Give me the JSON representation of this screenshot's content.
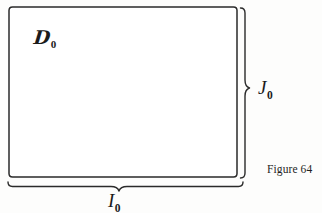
{
  "figure": {
    "caption": "Figure 64",
    "background_color": "#fdfdfc",
    "ink_color": "#1b1b1b",
    "width_px": 322,
    "height_px": 213
  },
  "rectangle": {
    "name": "domain-rectangle",
    "x": 9,
    "y": 7,
    "width": 228,
    "height": 170,
    "stroke_color": "#2a2a2a",
    "fill_color": "#ffffff"
  },
  "labels": {
    "domain": {
      "letter": "ℒ",
      "display_letter": "D",
      "subscript": "0",
      "full_text": "𝒟₀",
      "meaning": "script-D-sub-zero"
    },
    "height": {
      "letter": "J",
      "subscript": "0",
      "full_text": "J₀",
      "meaning": "interval-J-sub-zero"
    },
    "width": {
      "letter": "I",
      "subscript": "0",
      "full_text": "I₀",
      "meaning": "interval-I-sub-zero"
    }
  },
  "braces": {
    "vertical": {
      "name": "right-vertical-brace",
      "orientation": "vertical",
      "start": 8,
      "end": 178,
      "axis_position": 241,
      "peak_position": 88,
      "peak_offset": 8
    },
    "horizontal": {
      "name": "bottom-horizontal-brace",
      "orientation": "horizontal",
      "start": 8,
      "end": 243,
      "axis_position": 182,
      "peak_position": 119,
      "peak_offset": 8
    }
  }
}
